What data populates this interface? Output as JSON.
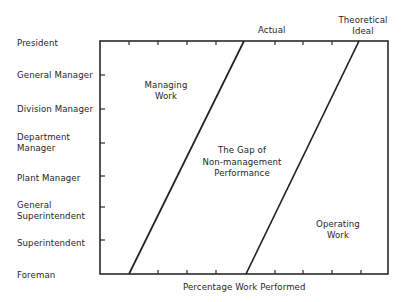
{
  "diagram": {
    "type": "management-work-gap-chart",
    "y_axis_levels": [
      {
        "label_lines": [
          "President"
        ]
      },
      {
        "label_lines": [
          "General Manager"
        ]
      },
      {
        "label_lines": [
          "Division Manager"
        ]
      },
      {
        "label_lines": [
          "Department",
          "Manager"
        ]
      },
      {
        "label_lines": [
          "Plant Manager"
        ]
      },
      {
        "label_lines": [
          "General",
          "Superintendent"
        ]
      },
      {
        "label_lines": [
          "Superintendent"
        ]
      },
      {
        "label_lines": [
          "Foreman"
        ]
      }
    ],
    "x_axis_label": "Percentage Work Performed",
    "lines": [
      {
        "name": "Actual",
        "label_lines": [
          "Actual"
        ]
      },
      {
        "name": "Theoretical Ideal",
        "label_lines": [
          "Theoretical",
          "Ideal"
        ]
      }
    ],
    "regions": {
      "managing_work": [
        "Managing",
        "Work"
      ],
      "gap": [
        "The Gap of",
        "Non-management",
        "Performance"
      ],
      "operating_work": [
        "Operating",
        "Work"
      ]
    },
    "colors": {
      "ink": "#262626",
      "background": "#ffffff"
    }
  }
}
